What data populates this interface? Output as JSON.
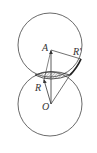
{
  "diagram": {
    "labels": {
      "A": "A",
      "O": "O",
      "R": "R",
      "R_prime": "R'"
    },
    "colors": {
      "stroke": "#333333",
      "hatch": "#777777",
      "background": "#ffffff"
    }
  }
}
